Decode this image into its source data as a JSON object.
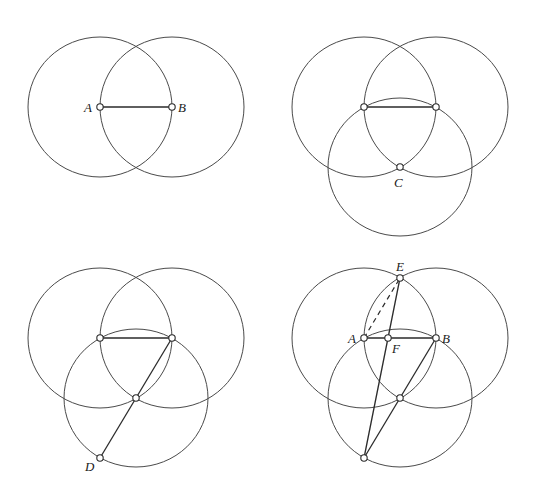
{
  "figure": {
    "stroke_color": "#4a4a4a",
    "background": "#ffffff"
  },
  "panels": [
    {
      "id": "step-1",
      "labels": {
        "A": "A",
        "B": "B"
      },
      "points": {
        "A": [
          100,
          107
        ],
        "B": [
          172,
          107
        ]
      },
      "circles": [
        "A",
        "B"
      ],
      "segments": [
        [
          "A",
          "B"
        ]
      ]
    },
    {
      "id": "step-2",
      "labels": {
        "C": "C"
      },
      "points": {
        "A": [
          364,
          107
        ],
        "B": [
          436,
          107
        ],
        "C": [
          400,
          167
        ]
      },
      "circles": [
        "A",
        "B",
        "C"
      ],
      "segments": [
        [
          "A",
          "B"
        ]
      ]
    },
    {
      "id": "step-3",
      "labels": {
        "D": "D"
      },
      "points": {
        "A": [
          100,
          338
        ],
        "B": [
          172,
          338
        ],
        "C": [
          136,
          398
        ],
        "D": [
          100,
          458
        ]
      },
      "circles": [
        "A",
        "B",
        "C"
      ],
      "segments": [
        [
          "A",
          "B"
        ],
        [
          "B",
          "D"
        ]
      ]
    },
    {
      "id": "step-4",
      "labels": {
        "A": "A",
        "B": "B",
        "E": "E",
        "F": "F"
      },
      "points": {
        "A": [
          364,
          338
        ],
        "B": [
          436,
          338
        ],
        "C": [
          400,
          398
        ],
        "D": [
          364,
          458
        ],
        "E": [
          400,
          278
        ],
        "F": [
          388,
          338
        ]
      },
      "circles": [
        "A",
        "B",
        "C"
      ],
      "segments": [
        [
          "A",
          "B"
        ],
        [
          "B",
          "D"
        ],
        [
          "E",
          "D"
        ]
      ],
      "dashed_segments": [
        [
          "A",
          "E"
        ]
      ]
    }
  ]
}
